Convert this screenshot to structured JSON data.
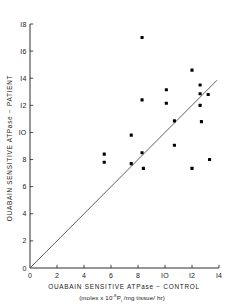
{
  "chart_data": {
    "type": "scatter",
    "title": "",
    "xlabel": "OUABAIN SENSITIVE ATPase − CONTROL",
    "xlabel_sub_prefix": "(moles x 10",
    "xlabel_sub_exp": "-8",
    "xlabel_sub_mid": "P",
    "xlabel_sub_isub": "i",
    "xlabel_sub_suffix": " /mg tissue/ hr)",
    "ylabel": "OUABAIN SENSITIVE ATPase − PATIENT",
    "xlim": [
      0,
      14
    ],
    "ylim": [
      0,
      18
    ],
    "xticks": [
      0,
      2,
      4,
      6,
      8,
      10,
      12,
      14
    ],
    "xtick_labels": [
      "0",
      "2",
      "4",
      "6",
      "8",
      "IO",
      "I2",
      "I4"
    ],
    "yticks": [
      0,
      2,
      4,
      6,
      8,
      10,
      12,
      14,
      16,
      18
    ],
    "ytick_labels": [
      "0",
      "2",
      "4",
      "6",
      "8",
      "IO",
      "I2",
      "I4",
      "I6",
      "I8"
    ],
    "grid": false,
    "legend": false,
    "marker": "filled-square",
    "marker_size_px": 3.1,
    "reference_line": {
      "name": "identity-line",
      "from": [
        0.05,
        0.05
      ],
      "to": [
        13.85,
        13.85
      ],
      "slope": 1,
      "intercept": 0
    },
    "points": [
      {
        "x": 5.5,
        "y": 8.4
      },
      {
        "x": 5.5,
        "y": 7.8
      },
      {
        "x": 7.5,
        "y": 9.8
      },
      {
        "x": 7.5,
        "y": 7.7
      },
      {
        "x": 8.3,
        "y": 17.0
      },
      {
        "x": 8.3,
        "y": 12.4
      },
      {
        "x": 8.3,
        "y": 8.5
      },
      {
        "x": 8.4,
        "y": 7.35
      },
      {
        "x": 10.1,
        "y": 13.15
      },
      {
        "x": 10.1,
        "y": 12.15
      },
      {
        "x": 10.7,
        "y": 10.85
      },
      {
        "x": 10.7,
        "y": 9.05
      },
      {
        "x": 12.0,
        "y": 14.6
      },
      {
        "x": 12.0,
        "y": 7.35
      },
      {
        "x": 12.6,
        "y": 13.5
      },
      {
        "x": 12.6,
        "y": 12.85
      },
      {
        "x": 12.6,
        "y": 12.0
      },
      {
        "x": 12.7,
        "y": 10.8
      },
      {
        "x": 13.2,
        "y": 12.8
      },
      {
        "x": 13.3,
        "y": 8.0
      }
    ]
  },
  "figure": {
    "background_color": "#ffffff",
    "ink_color": "#1a1a1a",
    "point_color": "#000000"
  }
}
